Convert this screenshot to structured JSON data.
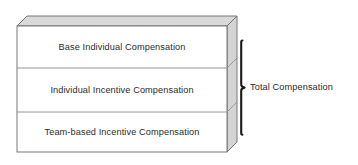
{
  "diagram": {
    "type": "stacked-3d-block-diagram",
    "title": "",
    "colors": {
      "background": "#ffffff",
      "front_face": "#ffffff",
      "top_face": "#d9d9d9",
      "side_face": "#d4d4d4",
      "outline": "#6b6b6b",
      "divider": "#8a8a8a",
      "text": "#2b2b2b",
      "bracket": "#1a1a1a"
    },
    "bands": [
      {
        "id": "base",
        "label": "Base Individual Compensation"
      },
      {
        "id": "individual-incentive",
        "label": "Individual Incentive Compensation"
      },
      {
        "id": "team-incentive",
        "label": "Team-based Incentive Compensation"
      }
    ],
    "bracket": {
      "label": "Total Compensation",
      "spans": [
        "base",
        "individual-incentive",
        "team-incentive"
      ]
    }
  }
}
